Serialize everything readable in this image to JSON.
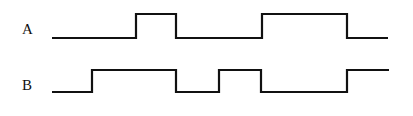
{
  "diagram": {
    "type": "timing-diagram",
    "signals": [
      {
        "name": "A",
        "low_y": 38,
        "high_y": 14,
        "x_start": 52,
        "x_end": 388,
        "initial_level": "low",
        "transitions_x": [
          136,
          176,
          262,
          347
        ],
        "levels": [
          "low",
          "high",
          "low",
          "high",
          "low"
        ]
      },
      {
        "name": "B",
        "low_y": 92,
        "high_y": 70,
        "x_start": 52,
        "x_end": 389,
        "initial_level": "low",
        "transitions_x": [
          92,
          176,
          219,
          261,
          347
        ],
        "levels": [
          "low",
          "high",
          "low",
          "high",
          "low",
          "high"
        ]
      }
    ],
    "stroke_color": "#111111",
    "background_color": "#ffffff"
  }
}
